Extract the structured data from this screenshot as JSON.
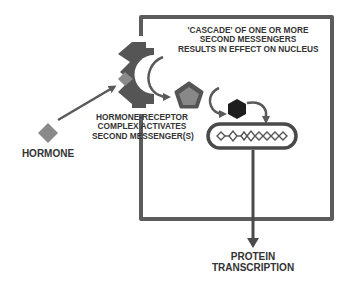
{
  "diagram": {
    "colors": {
      "cell_border": "#5c5c5c",
      "receptor": "#555555",
      "hormone": "#8a8a8a",
      "pentagon_outer": "#555555",
      "pentagon_inner": "#888888",
      "hexagon": "#1e1e1e",
      "arrow": "#5a5a5a",
      "text": "#333333"
    },
    "labels": {
      "cascade": {
        "lines": [
          "'CASCADE' OF ONE OR MORE",
          "SECOND MESSENGERS",
          "RESULTS IN EFFECT ON NUCLEUS"
        ]
      },
      "receptor_complex": {
        "lines": [
          "HORMONE-RECEPTOR",
          "COMPLEX ACTIVATES",
          "SECOND MESSENGER(S)"
        ]
      },
      "hormone": "HORMONE",
      "output": {
        "lines": [
          "PROTEIN",
          "TRANSCRIPTION"
        ]
      }
    },
    "nodes": [
      {
        "id": "hormone",
        "shape": "diamond"
      },
      {
        "id": "receptor",
        "shape": "notched-membrane-receptor"
      },
      {
        "id": "second-messenger-1",
        "shape": "pentagon"
      },
      {
        "id": "second-messenger-2",
        "shape": "hexagon"
      },
      {
        "id": "nucleus",
        "shape": "rounded-capsule",
        "content": "dna-helix"
      }
    ],
    "edges": [
      {
        "from": "hormone",
        "to": "receptor"
      },
      {
        "from": "receptor",
        "to": "second-messenger-1"
      },
      {
        "from": "second-messenger-1",
        "to": "second-messenger-2"
      },
      {
        "from": "second-messenger-2",
        "to": "nucleus"
      },
      {
        "from": "nucleus",
        "to": "protein-transcription"
      }
    ]
  }
}
